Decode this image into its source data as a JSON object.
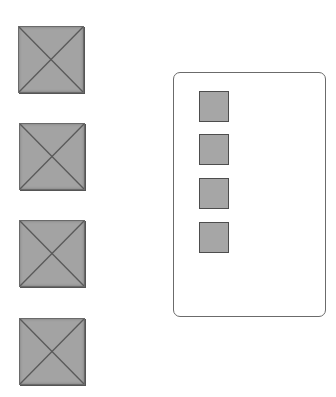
{
  "scene": {
    "background": "#ffffff",
    "pyramid_fill": "#a3a3a3",
    "pyramid_edge": "#5a5a5a",
    "slot_fill": "#a6a6a6",
    "slot_border": "#4d4d4d",
    "panel_border": "#6b6b6b"
  },
  "left_column": {
    "items": [
      {
        "id": "pyramid-1",
        "icon": "pyramid-top-view-icon"
      },
      {
        "id": "pyramid-2",
        "icon": "pyramid-top-view-icon"
      },
      {
        "id": "pyramid-3",
        "icon": "pyramid-top-view-icon"
      },
      {
        "id": "pyramid-4",
        "icon": "pyramid-top-view-icon"
      }
    ]
  },
  "panel": {
    "slots": [
      {
        "id": "slot-1"
      },
      {
        "id": "slot-2"
      },
      {
        "id": "slot-3"
      },
      {
        "id": "slot-4"
      }
    ]
  }
}
